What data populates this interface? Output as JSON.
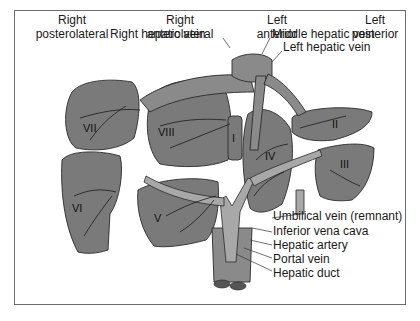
{
  "regions": [
    {
      "line1": "Right",
      "line2": "posterolateral"
    },
    {
      "line1": "Right",
      "line2": "anterolateral"
    },
    {
      "line1": "Left",
      "line2": "anterior"
    },
    {
      "line1": "Left",
      "line2": "posterior"
    }
  ],
  "vein_labels": {
    "right_hepatic": "Right hepatic vein",
    "middle_hepatic": "Middle hepatic vein",
    "left_hepatic": "Left hepatic vein"
  },
  "segments": [
    "I",
    "II",
    "III",
    "IV",
    "V",
    "VI",
    "VII",
    "VIII"
  ],
  "structure_labels": [
    "Umbilical vein (remnant)",
    "Inferior vena cava",
    "Hepatic artery",
    "Portal vein",
    "Hepatic duct"
  ],
  "colors": {
    "liver_fill": "#7a7a7a",
    "vessel_fill": "#a8a8a8",
    "outline": "#2a2a2a",
    "frame": "#6e6e6e"
  }
}
